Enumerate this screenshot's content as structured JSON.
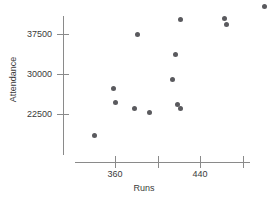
{
  "chart_data": {
    "type": "scatter",
    "title": "",
    "xlabel": "Runs",
    "ylabel": "Attendance",
    "xlim": [
      341,
      505
    ],
    "ylim": [
      17000,
      43500
    ],
    "grid": false,
    "legend": null,
    "xticks": [
      {
        "value": 360,
        "label": "360"
      },
      {
        "value": 400,
        "label": ""
      },
      {
        "value": 440,
        "label": "440"
      },
      {
        "value": 480,
        "label": ""
      }
    ],
    "yticks": [
      {
        "value": 37500,
        "label": "37500"
      },
      {
        "value": 30000,
        "label": "30000"
      },
      {
        "value": 22500,
        "label": "22500"
      }
    ],
    "series": [
      {
        "name": "Teams",
        "marker": "circle",
        "color": "#5a5a5e",
        "points": [
          {
            "x": 341,
            "y": 18500
          },
          {
            "x": 359,
            "y": 27200
          },
          {
            "x": 360,
            "y": 24600
          },
          {
            "x": 378,
            "y": 23500
          },
          {
            "x": 381,
            "y": 37400
          },
          {
            "x": 392,
            "y": 22700
          },
          {
            "x": 414,
            "y": 28900
          },
          {
            "x": 417,
            "y": 33700
          },
          {
            "x": 419,
            "y": 24300
          },
          {
            "x": 422,
            "y": 23500
          },
          {
            "x": 422,
            "y": 40200
          },
          {
            "x": 463,
            "y": 40400
          },
          {
            "x": 465,
            "y": 39300
          },
          {
            "x": 501,
            "y": 42700
          }
        ]
      }
    ]
  },
  "colors": {
    "marker": "#5a5a5e",
    "axis": "#8a8a8a",
    "text": "#3a3a3a",
    "background": "#ffffff"
  }
}
